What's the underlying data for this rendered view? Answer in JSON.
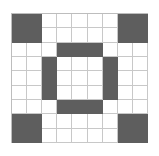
{
  "grid": {
    "rows": 9,
    "cols": 9,
    "fill_color": "#5e5e5e",
    "empty_color": "#ffffff",
    "line_color": "#c8c8c8",
    "cells": [
      [
        1,
        1,
        0,
        0,
        0,
        0,
        0,
        1,
        1
      ],
      [
        1,
        1,
        0,
        0,
        0,
        0,
        0,
        1,
        1
      ],
      [
        0,
        0,
        0,
        1,
        1,
        1,
        0,
        0,
        0
      ],
      [
        0,
        0,
        1,
        0,
        0,
        0,
        1,
        0,
        0
      ],
      [
        0,
        0,
        1,
        0,
        0,
        0,
        1,
        0,
        0
      ],
      [
        0,
        0,
        1,
        0,
        0,
        0,
        1,
        0,
        0
      ],
      [
        0,
        0,
        0,
        1,
        1,
        1,
        0,
        0,
        0
      ],
      [
        1,
        1,
        0,
        0,
        0,
        0,
        0,
        1,
        1
      ],
      [
        1,
        1,
        0,
        0,
        0,
        0,
        0,
        1,
        1
      ]
    ]
  }
}
